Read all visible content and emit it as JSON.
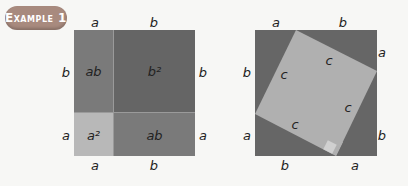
{
  "badge": {
    "label": "Example 1"
  },
  "colors": {
    "dark": "#6a6a6a",
    "medium": "#888888",
    "light": "#bdbdbd",
    "background": "#f7f7f5",
    "badge": "#a88a7e"
  },
  "left_figure": {
    "top_labels": [
      "a",
      "b"
    ],
    "bottom_labels": [
      "a",
      "b"
    ],
    "left_labels": [
      "b",
      "a"
    ],
    "right_labels": [
      "b",
      "a"
    ],
    "cells": {
      "top_left": "ab",
      "top_right": "b²",
      "bottom_left": "a²",
      "bottom_right": "ab"
    }
  },
  "right_figure": {
    "top_labels": [
      "a",
      "b"
    ],
    "bottom_labels": [
      "b",
      "a"
    ],
    "left_labels": [
      "b",
      "a"
    ],
    "right_labels": [
      "a",
      "b"
    ],
    "inner_square_sides": [
      "c",
      "c",
      "c",
      "c"
    ]
  }
}
